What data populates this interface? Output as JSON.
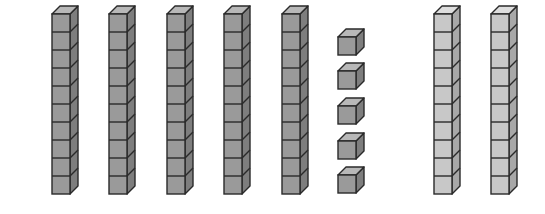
{
  "diagram": {
    "cube_size": 18,
    "depth": 8,
    "colors": {
      "dark_front": "#9a9a9a",
      "dark_top": "#b8b8b8",
      "dark_side": "#7e7e7e",
      "light_front": "#c8c8c8",
      "light_top": "#dedede",
      "light_side": "#a8a8a8",
      "stroke": "#2a2a2a"
    },
    "groups": [
      {
        "name": "dark-tens-rods",
        "shade": "dark",
        "kind": "rod",
        "cubes_per_item": 10,
        "items": [
          {
            "x": 52,
            "y": 14
          },
          {
            "x": 109,
            "y": 14
          },
          {
            "x": 167,
            "y": 14
          },
          {
            "x": 224,
            "y": 14
          },
          {
            "x": 282,
            "y": 14
          }
        ]
      },
      {
        "name": "unit-cubes",
        "shade": "dark",
        "kind": "unit",
        "cubes_per_item": 1,
        "items": [
          {
            "x": 338,
            "y": 37
          },
          {
            "x": 338,
            "y": 71
          },
          {
            "x": 338,
            "y": 106
          },
          {
            "x": 338,
            "y": 141
          },
          {
            "x": 338,
            "y": 175
          }
        ]
      },
      {
        "name": "light-tens-rods",
        "shade": "light",
        "kind": "rod",
        "cubes_per_item": 10,
        "items": [
          {
            "x": 434,
            "y": 14
          },
          {
            "x": 491,
            "y": 14
          }
        ]
      }
    ]
  }
}
